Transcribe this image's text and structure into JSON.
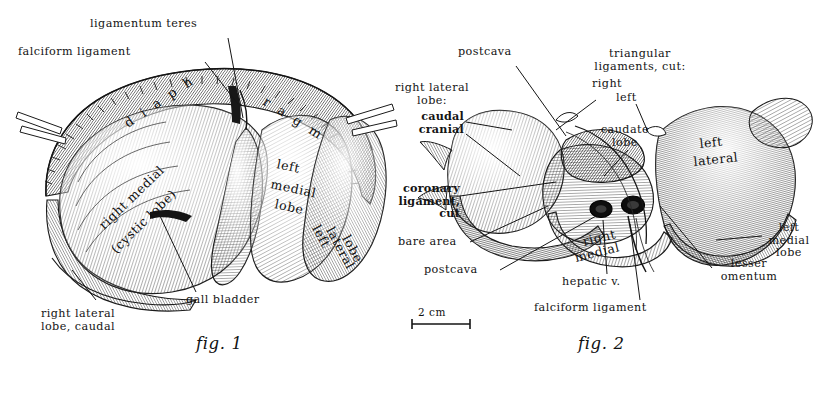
{
  "plate": {
    "title": "Liver of the cat — diaphragmatic and visceral surfaces",
    "ink_color": "#1a1a1a",
    "paper_color": "#ffffff"
  },
  "figures": [
    {
      "id": "fig1",
      "caption": "fig. 1",
      "view": "diaphragmatic (parietal) surface",
      "organ_labels": [
        {
          "name": "diaphragm",
          "text": "diaphragm"
        },
        {
          "name": "right-medial-cystic-lobe",
          "text": "right medial"
        },
        {
          "name": "right-medial-cystic-lobe-sub",
          "text": "(cystic lobe)"
        },
        {
          "name": "left-medial-lobe-1",
          "text": "left"
        },
        {
          "name": "left-medial-lobe-2",
          "text": "medial"
        },
        {
          "name": "left-medial-lobe-3",
          "text": "lobe"
        },
        {
          "name": "left-lateral-lobe-1",
          "text": "left"
        },
        {
          "name": "left-lateral-lobe-2",
          "text": "lateral"
        },
        {
          "name": "left-lateral-lobe-3",
          "text": "lobe"
        }
      ],
      "leader_labels": [
        {
          "name": "ligamentum-teres",
          "text": "ligamentum teres"
        },
        {
          "name": "falciform-ligament",
          "text": "falciform ligament"
        },
        {
          "name": "gall-bladder",
          "text": "gall bladder"
        },
        {
          "name": "right-lateral-lobe-caudal",
          "text": "right lateral\nlobe, caudal"
        }
      ]
    },
    {
      "id": "fig2",
      "caption": "fig. 2",
      "view": "visceral surface",
      "organ_labels": [
        {
          "name": "left-lateral-1",
          "text": "left"
        },
        {
          "name": "left-lateral-2",
          "text": "lateral"
        },
        {
          "name": "right-medial-1",
          "text": "right"
        },
        {
          "name": "right-medial-2",
          "text": "medial"
        }
      ],
      "leader_labels": [
        {
          "name": "postcava-top",
          "text": "postcava"
        },
        {
          "name": "right-lateral-lobe-heading",
          "text": "right lateral\nlobe:"
        },
        {
          "name": "right-lateral-lobe-caudal",
          "text": "caudal"
        },
        {
          "name": "right-lateral-lobe-cranial",
          "text": "cranial"
        },
        {
          "name": "triangular-ligaments-heading",
          "text": "triangular\nligaments, cut:"
        },
        {
          "name": "triangular-ligament-right",
          "text": "right"
        },
        {
          "name": "triangular-ligament-left",
          "text": "left"
        },
        {
          "name": "caudate-lobe",
          "text": "caudate\nlobe"
        },
        {
          "name": "coronary-ligament-cut",
          "text": "coronary\nligament,\ncut"
        },
        {
          "name": "bare-area",
          "text": "bare area"
        },
        {
          "name": "postcava-bottom",
          "text": "postcava"
        },
        {
          "name": "hepatic-v",
          "text": "hepatic v."
        },
        {
          "name": "falciform-ligament",
          "text": "falciform ligament"
        },
        {
          "name": "lesser-omentum",
          "text": "lesser\nomentum"
        },
        {
          "name": "left-medial-lobe",
          "text": "left\nmedial\nlobe"
        }
      ]
    }
  ],
  "scale_bar": {
    "name": "scale-bar",
    "label": "2 cm",
    "length_px": 58
  }
}
